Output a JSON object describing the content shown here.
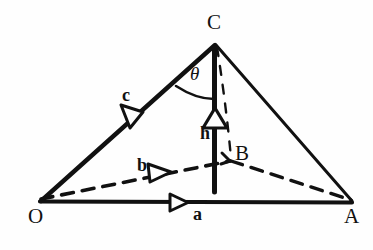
{
  "figure": {
    "type": "geometry-diagram",
    "background_color": "#fefefe",
    "ink_color": "#111111"
  },
  "vertices": [
    {
      "id": "O",
      "label": "O",
      "x": 40,
      "y": 202,
      "label_x": 28,
      "label_y": 206
    },
    {
      "id": "A",
      "label": "A",
      "x": 352,
      "y": 202,
      "label_x": 344,
      "label_y": 206
    },
    {
      "id": "C",
      "label": "C",
      "x": 215,
      "y": 44,
      "label_x": 207,
      "label_y": 12
    },
    {
      "id": "B",
      "label": "B",
      "x": 230,
      "y": 161,
      "label_x": 235,
      "label_y": 143
    }
  ],
  "vectors": [
    {
      "id": "a",
      "label": "a",
      "from": "O",
      "to": "A",
      "style": "solid-thick",
      "label_x": 193,
      "label_y": 205,
      "arrow_x": 178,
      "arrow_y": 202
    },
    {
      "id": "b",
      "label": "b",
      "from": "O",
      "to": "B",
      "style": "dashed",
      "label_x": 137,
      "label_y": 156,
      "arrow_x": 152,
      "arrow_y": 172
    },
    {
      "id": "c",
      "label": "c",
      "from": "O",
      "to": "C",
      "style": "solid-thick",
      "label_x": 122,
      "label_y": 86,
      "arrow_x": 126,
      "arrow_y": 112
    },
    {
      "id": "h",
      "label": "h",
      "from": "B",
      "to": "C",
      "style": "solid-thick-vertical",
      "label_x": 200,
      "label_y": 124,
      "arrow_x": 215,
      "arrow_y": 112
    }
  ],
  "angle": {
    "id": "theta",
    "label": "θ",
    "label_x": 190,
    "label_y": 64,
    "between": [
      "c",
      "h"
    ],
    "vertex": "C"
  },
  "edges": [
    {
      "id": "OA",
      "from": "O",
      "to": "A",
      "style": "solid-thick"
    },
    {
      "id": "OC",
      "from": "O",
      "to": "C",
      "style": "solid-thick"
    },
    {
      "id": "CA",
      "from": "C",
      "to": "A",
      "style": "solid-thin"
    },
    {
      "id": "OB",
      "from": "O",
      "to": "B",
      "style": "dashed"
    },
    {
      "id": "BA",
      "from": "B",
      "to": "A",
      "style": "dashed"
    },
    {
      "id": "CB-projection",
      "from": "C",
      "to": "B",
      "style": "dashed-thin"
    },
    {
      "id": "BC-altitude",
      "from": "B",
      "to": "C",
      "style": "solid-thick-vertical"
    }
  ]
}
